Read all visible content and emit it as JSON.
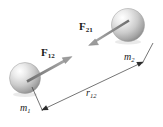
{
  "figure": {
    "kind": "physics-free-body-diagram",
    "background_color": "#ffffff",
    "width": 163,
    "height": 127
  },
  "bodies": [
    {
      "id": "mass-1",
      "label_base": "m",
      "label_sub": "1",
      "cx": 25,
      "cy": 78,
      "r": 15.5,
      "fill_light": "#fdfdfd",
      "fill_mid": "#cfcfcf",
      "fill_dark": "#8e8e8e"
    },
    {
      "id": "mass-2",
      "label_base": "m",
      "label_sub": "2",
      "cx": 128,
      "cy": 25,
      "r": 16.5,
      "fill_light": "#fdfdfd",
      "fill_mid": "#cfcfcf",
      "fill_dark": "#8e8e8e"
    }
  ],
  "forces": [
    {
      "id": "force-F12",
      "label_base": "F",
      "label_sub": "12",
      "acts_on": "mass-1",
      "points_toward": "mass-2",
      "tail": [
        28,
        81
      ],
      "head": [
        72,
        57
      ],
      "color": "#8a8a8a"
    },
    {
      "id": "force-F21",
      "label_base": "F",
      "label_sub": "21",
      "acts_on": "mass-2",
      "points_toward": "mass-1",
      "tail": [
        128,
        21
      ],
      "head": [
        89,
        45
      ],
      "color": "#8a8a8a"
    }
  ],
  "dimension": {
    "id": "separation-r12",
    "label_base": "r",
    "label_sub": "12",
    "from": [
      42,
      110
    ],
    "to": [
      143,
      62
    ],
    "color": "#3a3a3a",
    "extension_left": {
      "from": [
        32,
        87
      ],
      "to": [
        43,
        112
      ]
    },
    "extension_right": {
      "from": [
        153,
        43
      ],
      "to": [
        141,
        64
      ]
    }
  },
  "colors": {
    "line": "#3a3a3a",
    "arrow": "#8a8a8a",
    "text": "#1a1a1a",
    "background": "#ffffff"
  }
}
